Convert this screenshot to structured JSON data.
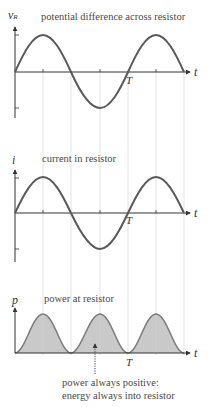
{
  "figure": {
    "panels": [
      {
        "id": "voltage",
        "title": "potential difference across resistor",
        "y_axis_label": "v",
        "y_axis_subscript": "R",
        "x_axis_label": "t",
        "period_label": "T",
        "shape": "sine",
        "cycles": 1.5
      },
      {
        "id": "current",
        "title": "current in resistor",
        "y_axis_label": "i",
        "x_axis_label": "t",
        "period_label": "T",
        "shape": "sine",
        "cycles": 1.5
      },
      {
        "id": "power",
        "title": "power at resistor",
        "y_axis_label": "p",
        "x_axis_label": "t",
        "period_label": "T",
        "shape": "sine-squared (filled)",
        "cycles": 1.5
      }
    ],
    "annotation": {
      "line1": "power always positive:",
      "line2": "energy always into resistor"
    },
    "colors": {
      "curve": "#5a5a5a",
      "fill": "#c9c9c9",
      "axis": "#333333",
      "gridline": "#d8d8d8",
      "text": "#4a4a4a"
    }
  }
}
